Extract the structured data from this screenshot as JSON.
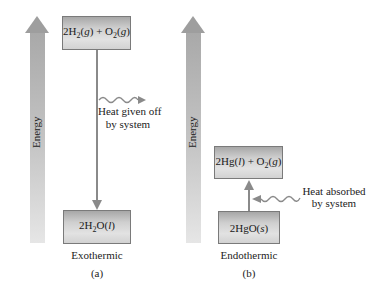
{
  "diagram": {
    "colors": {
      "energy_arrow": "#a9a9a9",
      "box_fill": "#d2d2d2",
      "line": "#8a8a8a",
      "text": "#222222"
    },
    "panel_a": {
      "axis_label": "Energy",
      "top_state": {
        "parts": [
          "2H",
          "2",
          "(",
          "g",
          ") + O",
          "2",
          "(",
          "g",
          ")"
        ]
      },
      "bottom_state": {
        "parts": [
          "2H",
          "2",
          "O(",
          "l",
          ")"
        ]
      },
      "transition_direction": "down",
      "heat_label_line1": "Heat given off",
      "heat_label_line2": "by system",
      "heat_arrow_direction": "outward",
      "type_label": "Exothermic",
      "panel_label": "(a)"
    },
    "panel_b": {
      "axis_label": "Energy",
      "top_state": {
        "parts": [
          "2Hg(",
          "l",
          ") + O",
          "2",
          "(",
          "g",
          ")"
        ]
      },
      "bottom_state": {
        "parts": [
          "2HgO(",
          "s",
          ")"
        ]
      },
      "transition_direction": "up",
      "heat_label_line1": "Heat absorbed",
      "heat_label_line2": "by system",
      "heat_arrow_direction": "inward",
      "type_label": "Endothermic",
      "panel_label": "(b)"
    }
  }
}
